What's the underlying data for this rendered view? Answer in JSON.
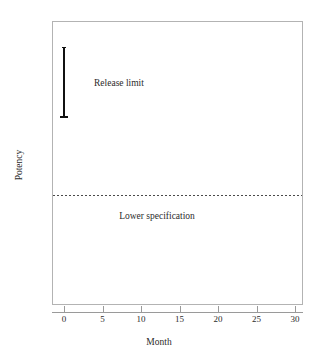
{
  "chart_data": {
    "type": "line",
    "title": "",
    "xlabel": "Month",
    "ylabel": "Potency",
    "xlim": [
      0,
      30
    ],
    "ylim": [
      0,
      1
    ],
    "grid": false,
    "legend": "none",
    "x_ticks": [
      {
        "value": 0,
        "label": "0"
      },
      {
        "value": 5,
        "label": "5"
      },
      {
        "value": 10,
        "label": "10"
      },
      {
        "value": 15,
        "label": "15"
      },
      {
        "value": 20,
        "label": "20"
      },
      {
        "value": 25,
        "label": "25"
      },
      {
        "value": 30,
        "label": "30"
      }
    ],
    "y_ticks": [],
    "series": [
      {
        "name": "Release limit",
        "type": "interval-bar",
        "x": 0,
        "y_low": 0.658,
        "y_high": 0.908,
        "color": "#111111",
        "annotation": "Release limit"
      },
      {
        "name": "Lower specification",
        "type": "horizontal-reference-line",
        "y": 0.387,
        "style": "dotted",
        "color": "#4a4a4a",
        "annotation": "Lower specification"
      }
    ],
    "annotations": [
      {
        "text": "Release limit",
        "x": 3.9,
        "y": 0.78
      },
      {
        "text": "Lower specification",
        "x": 15.9,
        "y": 0.31
      }
    ]
  },
  "figure": {
    "background": "#ffffff",
    "frame_color": "#b3b3b3",
    "axis_color": "#9a9a9a",
    "text_color": "#2b2b2b"
  },
  "labels": {
    "y_axis_title": "Potency",
    "x_axis_title": "Month",
    "release_limit": "Release limit",
    "lower_specification": "Lower specification"
  },
  "ticks": {
    "x": [
      "0",
      "5",
      "10",
      "15",
      "20",
      "25",
      "30"
    ]
  }
}
